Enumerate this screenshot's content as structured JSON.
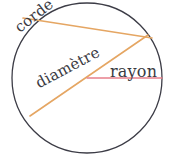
{
  "diagram": {
    "background_color": "#ffffff",
    "circle": {
      "name": "circle-outline",
      "center_x": 87,
      "center_y": 78,
      "radius": 75,
      "stroke_color": "#3c3c46",
      "stroke_width": 1.3,
      "fill": "none"
    },
    "lines": [
      {
        "name": "chord-line",
        "label": "corde",
        "color": "#e5a663",
        "width": 1.6,
        "x1": 23,
        "y1": 18,
        "x2": 152,
        "y2": 38
      },
      {
        "name": "diameter-line",
        "label": "diamètre",
        "color": "#e5a663",
        "width": 1.6,
        "x1": 30,
        "y1": 116,
        "x2": 148,
        "y2": 35
      },
      {
        "name": "radius-line",
        "label": "rayon",
        "color": "#e8808c",
        "width": 1.3,
        "x1": 87,
        "y1": 78,
        "x2": 162,
        "y2": 78
      }
    ],
    "labels": {
      "corde": "corde",
      "diametre": "diamètre",
      "rayon": "rayon"
    }
  }
}
